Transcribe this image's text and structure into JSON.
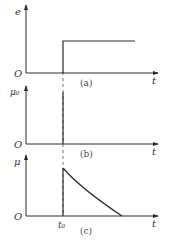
{
  "figure": {
    "colors": {
      "line": "#2a2a2a",
      "dash": "#555555",
      "text": "#333333"
    },
    "panels": [
      {
        "id": "a",
        "caption": "(a)",
        "y_label": "e",
        "x_label": "t",
        "origin_label": "O",
        "description": "step function: zero before t0, constant after t0"
      },
      {
        "id": "b",
        "caption": "(b)",
        "y_label": "μ₀",
        "x_label": "t",
        "origin_label": "O",
        "description": "impulse at t0"
      },
      {
        "id": "c",
        "caption": "(c)",
        "y_label": "μ",
        "x_label": "t",
        "origin_label": "O",
        "t0_label": "t₀",
        "description": "jump at t0 then decaying curve to zero"
      }
    ]
  }
}
